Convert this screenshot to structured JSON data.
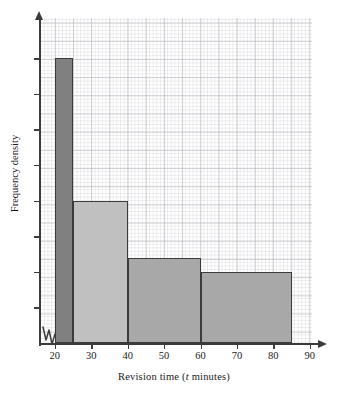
{
  "figure": {
    "background": "#ffffff",
    "grid_color": "#9aa0a8",
    "axis_color": "#3b3b3b"
  },
  "axes": {
    "x_title_prefix": "Revision time (",
    "x_title_variable": "t",
    "x_title_suffix": " minutes)",
    "x_title_full": "Revision time (t minutes)",
    "y_title": "Frequency density",
    "x_ticks": [
      "20",
      "30",
      "40",
      "50",
      "60",
      "70",
      "80",
      "90"
    ],
    "x_break_symbol": "zigzag-axis-break"
  },
  "chart_data": {
    "type": "bar",
    "title": "",
    "xlabel": "Revision time (t minutes)",
    "ylabel": "Frequency density",
    "xlim": [
      20,
      90
    ],
    "ylim": [
      0,
      4.5
    ],
    "xtick_labels": [
      "20",
      "30",
      "40",
      "50",
      "60",
      "70",
      "80",
      "90"
    ],
    "xtick_values": [
      20,
      30,
      40,
      50,
      60,
      70,
      80,
      90
    ],
    "ytick_labels": [],
    "ytick_values": [
      0.5,
      1.0,
      1.5,
      2.0,
      2.5,
      3.0,
      3.5,
      4.0
    ],
    "grid": true,
    "legend": "none",
    "bars": [
      {
        "label": "20 < t ≤ 25",
        "x_start": 20,
        "x_end": 25,
        "frequency_density": 4.0,
        "width": 5,
        "frequency": 20,
        "fill": "#808080"
      },
      {
        "label": "25 < t ≤ 40",
        "x_start": 25,
        "x_end": 40,
        "frequency_density": 2.0,
        "width": 15,
        "frequency": 30,
        "fill": "#c0c0c0"
      },
      {
        "label": "40 < t ≤ 60",
        "x_start": 40,
        "x_end": 60,
        "frequency_density": 1.2,
        "width": 20,
        "frequency": 24,
        "fill": "#a8a8a8"
      },
      {
        "label": "60 < t ≤ 85",
        "x_start": 60,
        "x_end": 85,
        "frequency_density": 1.0,
        "width": 25,
        "frequency": 25,
        "fill": "#a8a8a8"
      }
    ]
  }
}
